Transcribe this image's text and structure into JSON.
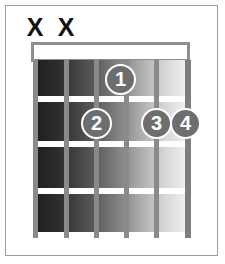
{
  "diagram": {
    "type": "guitar-chord-diagram",
    "title": "",
    "frets": 4,
    "strings": 6,
    "nut_shown": true,
    "colors": {
      "border": "#9c9c9c",
      "nut": "#8e8e8e",
      "string": "#8a8a8a",
      "fret_line": "#ffffff",
      "dot_fill": "#6e6e6e",
      "dot_ring": "#ffffff",
      "dot_text": "#ffffff",
      "mute_mark": "#111111",
      "board_dark": "#1d1d1d",
      "board_light": "#f2f2f2"
    },
    "mute_markers": [
      {
        "label": "X",
        "string": 1,
        "x": 23
      },
      {
        "label": "X",
        "string": 2,
        "x": 54
      }
    ],
    "strings_x": [
      33,
      64,
      94,
      124,
      154,
      185
    ],
    "fret_lines_y": [
      96,
      141,
      188,
      232
    ],
    "fret_cells": [
      {
        "index": 1,
        "top": 0,
        "height": 36
      },
      {
        "index": 2,
        "top": 42,
        "height": 39
      },
      {
        "index": 3,
        "top": 87,
        "height": 41
      },
      {
        "index": 4,
        "top": 134,
        "height": 38
      }
    ],
    "finger_positions": [
      {
        "finger": "1",
        "string": 4,
        "fret": 1,
        "x": 105,
        "y": 64
      },
      {
        "finger": "2",
        "string": 3,
        "fret": 2,
        "x": 81,
        "y": 108
      },
      {
        "finger": "3",
        "string": 5,
        "fret": 2,
        "x": 141,
        "y": 108
      },
      {
        "finger": "4",
        "string": 6,
        "fret": 2,
        "x": 170,
        "y": 108
      }
    ]
  }
}
